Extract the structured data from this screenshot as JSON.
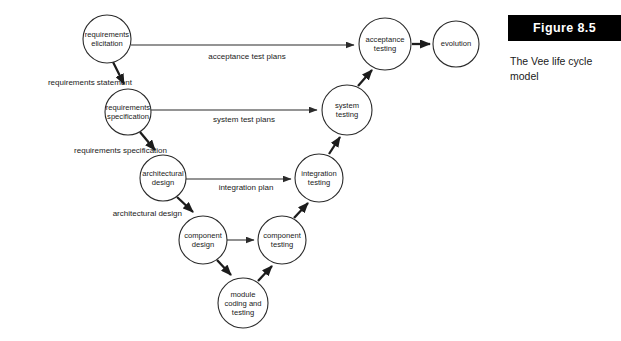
{
  "figure": {
    "banner_label": "Figure  8.5",
    "caption": "The Vee life cycle model"
  },
  "diagram": {
    "title": "The Vee life cycle model",
    "type": "flow-diagram",
    "nodes": [
      {
        "id": "requirements-elicitation",
        "label_lines": [
          "requirements",
          "elicitation"
        ],
        "cx": 107,
        "cy": 39,
        "r": 24
      },
      {
        "id": "requirements-specification",
        "label_lines": [
          "requirements",
          "specification"
        ],
        "cx": 128,
        "cy": 112,
        "r": 23
      },
      {
        "id": "architectural-design",
        "label_lines": [
          "architectural",
          "design"
        ],
        "cx": 163,
        "cy": 178,
        "r": 23
      },
      {
        "id": "component-design",
        "label_lines": [
          "component",
          "design"
        ],
        "cx": 203,
        "cy": 240,
        "r": 24
      },
      {
        "id": "module-coding-and-testing",
        "label_lines": [
          "module",
          "coding and",
          "testing"
        ],
        "cx": 243,
        "cy": 303,
        "r": 25
      },
      {
        "id": "component-testing",
        "label_lines": [
          "component",
          "testing"
        ],
        "cx": 282,
        "cy": 240,
        "r": 24
      },
      {
        "id": "integration-testing",
        "label_lines": [
          "integration",
          "testing"
        ],
        "cx": 319,
        "cy": 178,
        "r": 24
      },
      {
        "id": "system-testing",
        "label_lines": [
          "system",
          "testing"
        ],
        "cx": 347,
        "cy": 110,
        "r": 25
      },
      {
        "id": "acceptance-testing",
        "label_lines": [
          "acceptance",
          "testing"
        ],
        "cx": 385,
        "cy": 44,
        "r": 26
      },
      {
        "id": "evolution",
        "label_lines": [
          "evolution"
        ],
        "cx": 456,
        "cy": 44,
        "r": 23
      }
    ],
    "edge_labels": [
      {
        "id": "acceptance-test-plans",
        "text": "acceptance test plans",
        "x": 247,
        "y": 59,
        "anchor": "middle"
      },
      {
        "id": "requirements-statement",
        "text": "requirements statement",
        "x": 132,
        "y": 85,
        "anchor": "end"
      },
      {
        "id": "system-test-plans",
        "text": "system test plans",
        "x": 244,
        "y": 122,
        "anchor": "middle"
      },
      {
        "id": "requirements-specification-label",
        "text": "requirements specification",
        "x": 167,
        "y": 153,
        "anchor": "end"
      },
      {
        "id": "integration-plan",
        "text": "integration plan",
        "x": 246,
        "y": 190,
        "anchor": "middle"
      },
      {
        "id": "architectural-design-label",
        "text": "architectural design",
        "x": 182,
        "y": 216,
        "anchor": "end"
      }
    ]
  }
}
